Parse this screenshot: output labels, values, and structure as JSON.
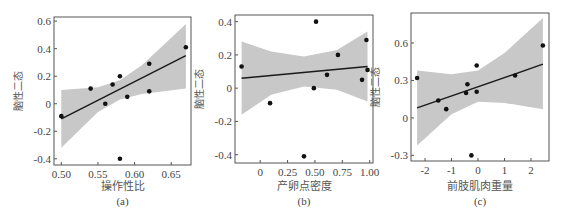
{
  "chart_data": [
    {
      "id": "a",
      "type": "scatter",
      "title": "",
      "panel_label": "(a)",
      "xlabel": "操作性比",
      "ylabel": "脑性二态",
      "xlim": [
        0.49,
        0.677
      ],
      "ylim": [
        -0.445,
        0.63
      ],
      "xticks": [
        0.5,
        0.55,
        0.6,
        0.65
      ],
      "xtick_labels": [
        "0.50",
        "0.55",
        "0.60",
        "0.65"
      ],
      "yticks": [
        -0.4,
        -0.2,
        0,
        0.2,
        0.4,
        0.6
      ],
      "ytick_labels": [
        "-0.4",
        "-0.2",
        "0",
        "0.2",
        "0.4",
        "0.6"
      ],
      "points": [
        {
          "x": 0.5,
          "y": -0.09
        },
        {
          "x": 0.54,
          "y": 0.11
        },
        {
          "x": 0.56,
          "y": 0.0
        },
        {
          "x": 0.57,
          "y": 0.14
        },
        {
          "x": 0.58,
          "y": 0.2
        },
        {
          "x": 0.59,
          "y": 0.05
        },
        {
          "x": 0.62,
          "y": 0.29
        },
        {
          "x": 0.62,
          "y": 0.09
        },
        {
          "x": 0.67,
          "y": 0.41
        },
        {
          "x": 0.58,
          "y": -0.4
        }
      ],
      "fit_line": {
        "x": [
          0.5,
          0.67
        ],
        "y": [
          -0.11,
          0.35
        ]
      },
      "ci_band": {
        "x": [
          0.5,
          0.55,
          0.58,
          0.61,
          0.67
        ],
        "upper": [
          0.1,
          0.12,
          0.17,
          0.28,
          0.58
        ],
        "lower": [
          -0.32,
          -0.06,
          0.03,
          0.07,
          0.11
        ]
      },
      "grid": false
    },
    {
      "id": "b",
      "type": "scatter",
      "title": "",
      "panel_label": "(b)",
      "xlabel": "产卵点密度",
      "ylabel": "脑性二态",
      "xlim": [
        -0.23,
        1.03
      ],
      "ylim": [
        -0.45,
        0.44
      ],
      "xticks": [
        0,
        0.25,
        0.5,
        0.75,
        1.0
      ],
      "xtick_labels": [
        "0",
        "0.25",
        "0.50",
        "0.75",
        "1.00"
      ],
      "yticks": [
        -0.4,
        -0.2,
        0,
        0.2,
        0.4
      ],
      "ytick_labels": [
        "-0.4",
        "-0.2",
        "0",
        "0.2",
        "0.4"
      ],
      "points": [
        {
          "x": -0.17,
          "y": 0.13
        },
        {
          "x": 0.09,
          "y": -0.09
        },
        {
          "x": 0.4,
          "y": -0.41
        },
        {
          "x": 0.49,
          "y": 0.0
        },
        {
          "x": 0.51,
          "y": 0.4
        },
        {
          "x": 0.61,
          "y": 0.08
        },
        {
          "x": 0.71,
          "y": 0.2
        },
        {
          "x": 0.93,
          "y": 0.05
        },
        {
          "x": 0.97,
          "y": 0.29
        },
        {
          "x": 0.98,
          "y": 0.11
        }
      ],
      "fit_line": {
        "x": [
          -0.17,
          0.98
        ],
        "y": [
          0.06,
          0.13
        ]
      },
      "ci_band": {
        "x": [
          -0.17,
          0.1,
          0.4,
          0.7,
          0.98
        ],
        "upper": [
          0.28,
          0.22,
          0.19,
          0.23,
          0.34
        ],
        "lower": [
          -0.16,
          -0.04,
          0.01,
          -0.01,
          -0.08
        ]
      },
      "grid": false
    },
    {
      "id": "c",
      "type": "scatter",
      "title": "",
      "panel_label": "(c)",
      "xlabel": "前肢肌肉重量",
      "ylabel": "脑性二态",
      "xlim": [
        -2.53,
        2.68
      ],
      "ylim": [
        -0.345,
        0.84
      ],
      "xticks": [
        -2,
        -1,
        0,
        1,
        2
      ],
      "xtick_labels": [
        "-2",
        "-1",
        "0",
        "1",
        "2"
      ],
      "yticks": [
        -0.3,
        0,
        0.3,
        0.6
      ],
      "ytick_labels": [
        "-0.3",
        "0",
        "0.3",
        "0.6"
      ],
      "points": [
        {
          "x": -2.3,
          "y": 0.32
        },
        {
          "x": -1.5,
          "y": 0.14
        },
        {
          "x": -1.2,
          "y": 0.07
        },
        {
          "x": -0.45,
          "y": 0.2
        },
        {
          "x": -0.4,
          "y": 0.27
        },
        {
          "x": -0.05,
          "y": 0.42
        },
        {
          "x": -0.05,
          "y": 0.21
        },
        {
          "x": -0.25,
          "y": -0.3
        },
        {
          "x": 1.4,
          "y": 0.34
        },
        {
          "x": 2.45,
          "y": 0.58
        }
      ],
      "fit_line": {
        "x": [
          -2.3,
          2.45
        ],
        "y": [
          0.08,
          0.43
        ]
      },
      "ci_band": {
        "x": [
          -2.3,
          -1.0,
          0.0,
          1.0,
          2.45
        ],
        "upper": [
          0.38,
          0.35,
          0.38,
          0.52,
          0.8
        ],
        "lower": [
          -0.22,
          0.03,
          0.13,
          0.12,
          0.07
        ]
      },
      "grid": false
    }
  ],
  "frames": [
    {
      "left": 54,
      "top": 17,
      "right": 191,
      "bottom": 165
    },
    {
      "left": 235,
      "top": 15,
      "right": 373,
      "bottom": 163
    },
    {
      "left": 411,
      "top": 13,
      "right": 549,
      "bottom": 161
    }
  ],
  "colors": {
    "band": "#c8c8c8",
    "line": "#1a1a1a",
    "point": "#111111",
    "axis": "#555555"
  }
}
